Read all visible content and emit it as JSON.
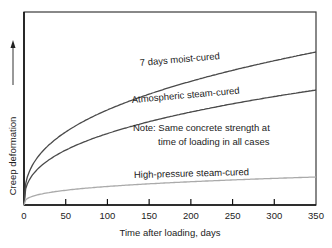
{
  "chart_data": {
    "type": "line",
    "title": "",
    "xlabel": "Time after loading, days",
    "ylabel": "Creep deformation",
    "xlim": [
      0,
      350
    ],
    "ylim": [
      0,
      100
    ],
    "x_ticks": [
      0,
      50,
      100,
      150,
      200,
      250,
      300,
      350
    ],
    "y_ticks": [],
    "grid": false,
    "legend": "inline labels",
    "x": [
      0,
      2,
      5,
      10,
      20,
      30,
      50,
      75,
      100,
      125,
      150,
      200,
      250,
      300,
      350
    ],
    "series": [
      {
        "name": "7 days moist-cured",
        "color": "#4a4a4a",
        "values": [
          0,
          18,
          28,
          38,
          48,
          54,
          61,
          67,
          71,
          74,
          77,
          81,
          84,
          86,
          79.5
        ]
      },
      {
        "name": "Atmospheric steam-cured",
        "color": "#4a4a4a",
        "values": [
          0,
          12,
          19,
          26,
          33,
          38,
          44,
          49,
          53,
          55,
          58,
          61,
          63,
          65,
          60
        ]
      },
      {
        "name": "High-pressure steam-cured",
        "color": "#aaaaaa",
        "values": [
          0,
          2.5,
          4,
          5,
          6.5,
          7.5,
          9,
          10.5,
          11.5,
          12.5,
          13.3,
          14.5,
          15.5,
          16.2,
          14.5
        ]
      }
    ],
    "annotations": [
      "Note: Same concrete strength at",
      "time of loading in all cases"
    ]
  },
  "labels": {
    "series_7day": "7 days moist-cured",
    "series_atm": "Atmospheric steam-cured",
    "series_hp": "High-pressure steam-cured",
    "note_line1": "Note: Same concrete strength at",
    "note_line2": "time of loading in all cases",
    "xlabel": "Time after loading, days",
    "ylabel": "Creep deformation",
    "ticks": [
      "0",
      "50",
      "100",
      "150",
      "200",
      "250",
      "300",
      "350"
    ]
  }
}
